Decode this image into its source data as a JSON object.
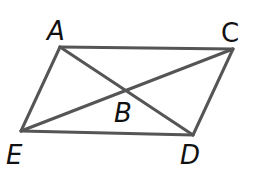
{
  "diagram": {
    "type": "parallelogram-with-diagonals",
    "stroke_color": "#555555",
    "label_color": "#111111",
    "points": {
      "A": {
        "x": 60,
        "y": 47
      },
      "C": {
        "x": 233,
        "y": 49
      },
      "D": {
        "x": 193,
        "y": 135
      },
      "E": {
        "x": 21,
        "y": 131
      },
      "B": {
        "x": 126,
        "y": 91
      }
    },
    "labels": {
      "A": "A",
      "B": "B",
      "C": "C",
      "D": "D",
      "E": "E"
    },
    "segments": [
      "AC",
      "CD",
      "DE",
      "EA",
      "AD",
      "EC"
    ]
  }
}
